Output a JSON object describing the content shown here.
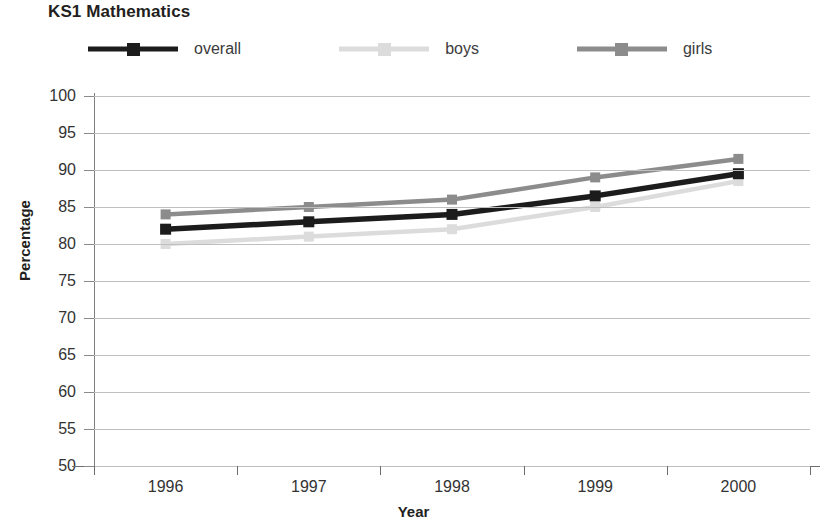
{
  "chart_data": {
    "type": "line",
    "title": "KS1 Mathematics",
    "xlabel": "Year",
    "ylabel": "Percentage",
    "categories": [
      "1996",
      "1997",
      "1998",
      "1999",
      "2000"
    ],
    "series": [
      {
        "name": "overall",
        "values": [
          82,
          83,
          84,
          86.5,
          89.5
        ],
        "color": "#1c1c1c"
      },
      {
        "name": "boys",
        "values": [
          80,
          81,
          82,
          85,
          88.5
        ],
        "color": "#dcdcdc"
      },
      {
        "name": "girls",
        "values": [
          84,
          85,
          86,
          89,
          91.5
        ],
        "color": "#8c8c8c"
      }
    ],
    "ylim": [
      50,
      100
    ],
    "ytick_step": 5,
    "ytick_labels": [
      "100",
      "95",
      "90",
      "85",
      "80",
      "75",
      "70",
      "65",
      "60",
      "55",
      "50"
    ],
    "grid": true,
    "grid_axis": "y",
    "legend_position": "top",
    "marker": "square"
  },
  "legend": {
    "items": [
      {
        "label": "overall",
        "key_name": "legend-key-overall"
      },
      {
        "label": "boys",
        "key_name": "legend-key-boys"
      },
      {
        "label": "girls",
        "key_name": "legend-key-girls"
      }
    ]
  },
  "colors": {
    "overall": "#1c1c1c",
    "boys": "#dcdcdc",
    "girls": "#8c8c8c",
    "gridline": "#bfbfbf",
    "axis": "#6e6e6e",
    "text": "#231f20"
  }
}
